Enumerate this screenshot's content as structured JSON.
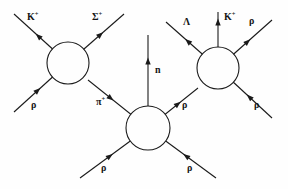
{
  "diagram": {
    "type": "particle-interaction-diagram",
    "title": "",
    "stroke_color": "#1a1a1a",
    "background_color": "#fefefe",
    "blobs": [
      {
        "name": "left-vertex-blob",
        "cx": 68,
        "cy": 63,
        "r": 21
      },
      {
        "name": "middle-vertex-blob",
        "cx": 148,
        "cy": 128,
        "r": 22
      },
      {
        "name": "right-vertex-blob",
        "cx": 218,
        "cy": 68,
        "r": 21
      }
    ],
    "lines": [
      {
        "name": "line-k-plus-out",
        "x1": 68,
        "y1": 63,
        "x2": 14,
        "y2": 14,
        "arrow_at": 0.55,
        "direction": "outgoing"
      },
      {
        "name": "line-sigma-plus-out",
        "x1": 68,
        "y1": 63,
        "x2": 124,
        "y2": 14,
        "arrow_at": 0.58,
        "direction": "outgoing"
      },
      {
        "name": "line-proton-in-left",
        "x1": 68,
        "y1": 63,
        "x2": 14,
        "y2": 112,
        "arrow_at": 0.56,
        "direction": "incoming"
      },
      {
        "name": "line-pi-plus-exchange",
        "x1": 148,
        "y1": 128,
        "x2": 88,
        "y2": 80,
        "arrow_at": 0.62,
        "direction": "incoming"
      },
      {
        "name": "line-neutron-out",
        "x1": 148,
        "y1": 128,
        "x2": 148,
        "y2": 35,
        "arrow_at": 0.72,
        "direction": "outgoing"
      },
      {
        "name": "line-proton-exchange-right",
        "x1": 148,
        "y1": 128,
        "x2": 198,
        "y2": 88,
        "arrow_at": 0.6,
        "direction": "outgoing"
      },
      {
        "name": "line-proton-in-bottom-left",
        "x1": 148,
        "y1": 128,
        "x2": 80,
        "y2": 178,
        "arrow_at": 0.56,
        "direction": "incoming"
      },
      {
        "name": "line-proton-in-bottom-right",
        "x1": 148,
        "y1": 128,
        "x2": 216,
        "y2": 178,
        "arrow_at": 0.56,
        "direction": "incoming"
      },
      {
        "name": "line-lambda-out",
        "x1": 218,
        "y1": 68,
        "x2": 166,
        "y2": 22,
        "arrow_at": 0.58,
        "direction": "outgoing"
      },
      {
        "name": "line-k-plus-up-out",
        "x1": 218,
        "y1": 68,
        "x2": 218,
        "y2": 12,
        "arrow_at": 0.82,
        "direction": "outgoing"
      },
      {
        "name": "line-proton-out-topright",
        "x1": 218,
        "y1": 68,
        "x2": 272,
        "y2": 20,
        "arrow_at": 0.55,
        "direction": "outgoing"
      },
      {
        "name": "line-proton-in-right",
        "x1": 218,
        "y1": 68,
        "x2": 272,
        "y2": 118,
        "arrow_at": 0.58,
        "direction": "incoming"
      }
    ],
    "labels": [
      {
        "name": "label-k-plus-left",
        "text": "K",
        "sup": "+",
        "x": 27,
        "y": 11
      },
      {
        "name": "label-sigma-plus",
        "text": "Σ",
        "sup": "+",
        "x": 92,
        "y": 11
      },
      {
        "name": "label-lambda",
        "text": "Λ",
        "sup": "",
        "x": 183,
        "y": 17
      },
      {
        "name": "label-k-plus-right",
        "text": "K",
        "sup": "+",
        "x": 224,
        "y": 11
      },
      {
        "name": "label-rho-top-right",
        "text": "ρ",
        "sup": "",
        "x": 249,
        "y": 16
      },
      {
        "name": "label-neutron",
        "text": "n",
        "sup": "",
        "x": 155,
        "y": 65
      },
      {
        "name": "label-rho-left",
        "text": "ρ",
        "sup": "",
        "x": 31,
        "y": 100
      },
      {
        "name": "label-pi-plus",
        "text": "π",
        "sup": "+",
        "x": 96,
        "y": 96
      },
      {
        "name": "label-rho-mid-right",
        "text": "ρ",
        "sup": "",
        "x": 182,
        "y": 100
      },
      {
        "name": "label-rho-far-right",
        "text": "ρ",
        "sup": "",
        "x": 254,
        "y": 100
      },
      {
        "name": "label-rho-bottom-left",
        "text": "ρ",
        "sup": "",
        "x": 101,
        "y": 163
      },
      {
        "name": "label-rho-bottom-right",
        "text": "ρ",
        "sup": "",
        "x": 187,
        "y": 163
      }
    ]
  }
}
